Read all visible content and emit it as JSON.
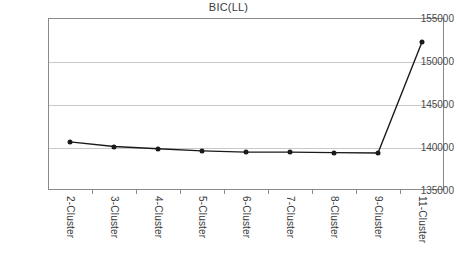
{
  "chart_data": {
    "type": "line",
    "title": "BIC(LL)",
    "xlabel": "",
    "ylabel": "",
    "categories": [
      "2-Cluster",
      "3-Cluster",
      "4-Cluster",
      "5-Cluster",
      "6-Cluster",
      "7-Cluster",
      "8-Cluster",
      "9-Cluster",
      "11-Cluster"
    ],
    "values": [
      140600,
      140050,
      139800,
      139550,
      139400,
      139400,
      139350,
      139300,
      152200
    ],
    "series": [
      {
        "name": "BIC(LL)",
        "values": [
          140600,
          140050,
          139800,
          139550,
          139400,
          139400,
          139350,
          139300,
          152200
        ]
      }
    ],
    "ylim": [
      135000,
      155000
    ],
    "yticks": [
      135000,
      140000,
      145000,
      150000,
      155000
    ],
    "ytick_labels": [
      "135000",
      "140000",
      "145000",
      "150000",
      "155000"
    ],
    "grid": true,
    "legend": false,
    "line_color": "#1a1a1a",
    "marker_color": "#1a1a1a",
    "grid_color": "#c9c9c9",
    "axis_color": "#8a8a8a",
    "background": "#ffffff"
  }
}
